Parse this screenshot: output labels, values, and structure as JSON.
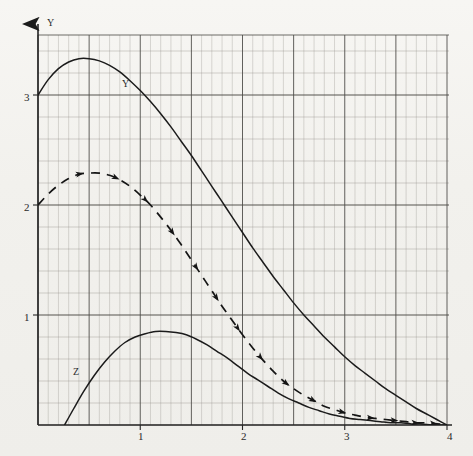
{
  "chart_data": {
    "type": "line",
    "title": "",
    "subtitle": "",
    "xlabel": "",
    "ylabel": "Y",
    "xlim": [
      0,
      4
    ],
    "ylim": [
      0,
      3.55
    ],
    "grid": true,
    "grid_major_x_step": 0.5,
    "grid_minor_x_step": 0.1,
    "grid_major_y_step": 1.0,
    "grid_minor_y_step": 0.2,
    "legend_position": "inline-annotations",
    "x_tick_labels": [
      "1",
      "2",
      "3",
      "4"
    ],
    "x_ticks": [
      1,
      2,
      3,
      4
    ],
    "y_tick_labels": [
      "1",
      "2",
      "3"
    ],
    "y_ticks": [
      1,
      2,
      3
    ],
    "series": [
      {
        "name": "Y",
        "label": "Y",
        "style": "solid",
        "color": "#1b1b1b",
        "annotation_x": 0.84,
        "annotation_y": 3.09,
        "x": [
          0.0,
          0.1,
          0.2,
          0.3,
          0.4,
          0.5,
          0.6,
          0.7,
          0.8,
          0.9,
          1.0,
          1.1,
          1.2,
          1.3,
          1.4,
          1.5,
          1.6,
          1.7,
          1.8,
          1.9,
          2.0,
          2.1,
          2.2,
          2.3,
          2.4,
          2.5,
          2.6,
          2.7,
          2.8,
          2.9,
          3.0,
          3.1,
          3.2,
          3.3,
          3.4,
          3.5,
          3.6,
          3.7,
          3.8,
          3.9,
          4.0
        ],
        "y": [
          3.0,
          3.14,
          3.24,
          3.3,
          3.33,
          3.33,
          3.31,
          3.27,
          3.21,
          3.13,
          3.04,
          2.94,
          2.83,
          2.71,
          2.58,
          2.45,
          2.31,
          2.17,
          2.03,
          1.89,
          1.75,
          1.61,
          1.48,
          1.35,
          1.23,
          1.11,
          1.0,
          0.9,
          0.8,
          0.71,
          0.62,
          0.54,
          0.47,
          0.4,
          0.33,
          0.27,
          0.21,
          0.15,
          0.1,
          0.05,
          0.0
        ]
      },
      {
        "name": "dashed-curve",
        "label": "",
        "style": "dashed-with-arrows",
        "color": "#151515",
        "x": [
          0.0,
          0.1,
          0.2,
          0.3,
          0.4,
          0.5,
          0.6,
          0.7,
          0.8,
          0.9,
          1.0,
          1.1,
          1.2,
          1.3,
          1.4,
          1.5,
          1.6,
          1.7,
          1.8,
          1.9,
          2.0,
          2.1,
          2.2,
          2.3,
          2.4,
          2.5,
          2.6,
          2.7,
          2.8,
          2.9,
          3.0,
          3.1,
          3.2,
          3.3,
          3.4,
          3.5,
          3.6,
          3.7,
          3.8,
          3.9,
          4.0
        ],
        "y": [
          2.0,
          2.1,
          2.18,
          2.24,
          2.28,
          2.29,
          2.29,
          2.27,
          2.23,
          2.17,
          2.09,
          2.0,
          1.89,
          1.77,
          1.64,
          1.5,
          1.36,
          1.22,
          1.08,
          0.95,
          0.82,
          0.7,
          0.59,
          0.49,
          0.4,
          0.33,
          0.27,
          0.22,
          0.17,
          0.14,
          0.11,
          0.09,
          0.07,
          0.06,
          0.05,
          0.04,
          0.03,
          0.02,
          0.02,
          0.01,
          0.01
        ]
      },
      {
        "name": "Z",
        "label": "Z",
        "style": "solid",
        "color": "#1b1b1b",
        "annotation_x": 0.37,
        "annotation_y": 0.49,
        "x": [
          0.26,
          0.35,
          0.45,
          0.55,
          0.65,
          0.75,
          0.85,
          0.95,
          1.05,
          1.15,
          1.25,
          1.35,
          1.45,
          1.55,
          1.65,
          1.75,
          1.85,
          1.95,
          2.05,
          2.15,
          2.25,
          2.35,
          2.45,
          2.55,
          2.65,
          2.75,
          2.85,
          2.95,
          3.05,
          3.15,
          3.25,
          3.35,
          3.45,
          3.55,
          3.65,
          3.75,
          3.85,
          3.95,
          4.0
        ],
        "y": [
          0.0,
          0.15,
          0.31,
          0.45,
          0.57,
          0.67,
          0.75,
          0.8,
          0.83,
          0.85,
          0.85,
          0.84,
          0.82,
          0.78,
          0.73,
          0.67,
          0.61,
          0.54,
          0.47,
          0.41,
          0.35,
          0.29,
          0.24,
          0.2,
          0.16,
          0.13,
          0.1,
          0.08,
          0.06,
          0.05,
          0.04,
          0.03,
          0.02,
          0.02,
          0.01,
          0.01,
          0.0,
          0.0,
          0.0
        ]
      }
    ]
  },
  "axes": {
    "y_axis_name": "Y",
    "x_tick_labels": [
      "1",
      "2",
      "3",
      "4"
    ],
    "y_tick_labels": [
      "3",
      "2",
      "1"
    ]
  },
  "colors": {
    "grid_major": "#4c4a47",
    "grid_minor": "#8d8a85",
    "curve": "#151515",
    "paper": "#f2f1ed"
  }
}
